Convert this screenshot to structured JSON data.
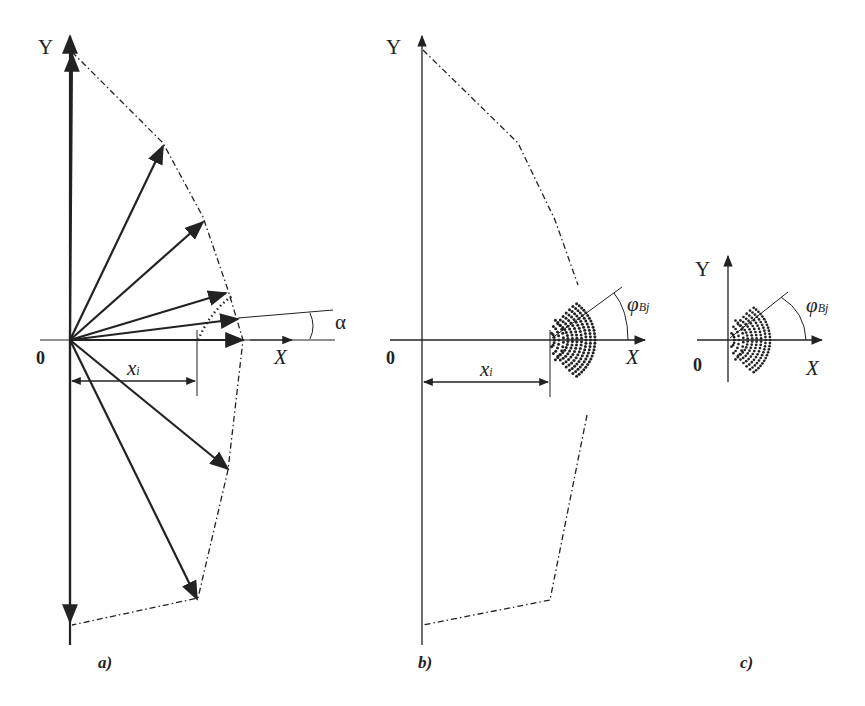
{
  "figure": {
    "panels": [
      {
        "id": "a",
        "caption": "a)",
        "y_axis_label": "Y",
        "x_axis_label": "X",
        "origin_label": "0",
        "distance_label": "x",
        "distance_subscript": "i",
        "angle_label": "α",
        "description": "Fan of force/velocity vectors from origin with dash-dot envelope polygon"
      },
      {
        "id": "b",
        "caption": "b)",
        "y_axis_label": "Y",
        "x_axis_label": "X",
        "origin_label": "0",
        "distance_label": "x",
        "distance_subscript": "i",
        "angle_label": "φ",
        "angle_subscript": "Bj",
        "description": "Envelope polygon with dotted fan of points at distance xi"
      },
      {
        "id": "c",
        "caption": "c)",
        "y_axis_label": "Y",
        "x_axis_label": "X",
        "origin_label": "0",
        "angle_label": "φ",
        "angle_subscript": "Bj",
        "description": "Dotted fan of points at origin"
      }
    ],
    "colors": {
      "ink": "#222222",
      "background": "#ffffff"
    }
  }
}
